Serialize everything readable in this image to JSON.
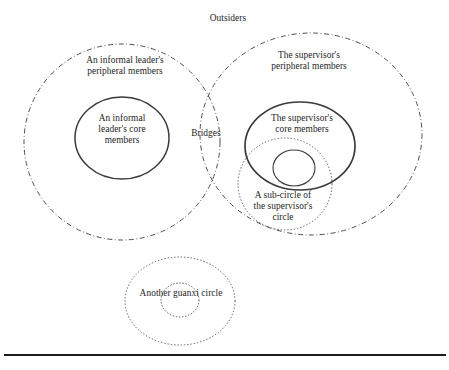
{
  "figure": {
    "background_color": "#ffffff",
    "stroke_color": "#3a3a3a",
    "labels": {
      "outsiders": "Outsiders",
      "leader_peripheral": "An informal leader's\nperipheral members",
      "leader_core": "An informal\nleader's core\nmembers",
      "bridges": "Bridges",
      "supervisor_peripheral": "The supervisor's\nperipheral members",
      "supervisor_core": "The supervisor's\ncore members",
      "sub_circle": "A sub-circle of\nthe supervisor's\ncircle",
      "another_guanxi": "Another guanxi circle"
    },
    "shapes": [
      {
        "name": "informal-leader-peripheral-circle",
        "style": "dash-dot",
        "cx": 122,
        "cy": 142,
        "rx": 98,
        "ry": 98
      },
      {
        "name": "supervisor-peripheral-circle",
        "style": "dash-dot",
        "cx": 311,
        "cy": 134,
        "rx": 111,
        "ry": 101
      },
      {
        "name": "informal-leader-core-circle",
        "style": "solid",
        "cx": 122,
        "cy": 138,
        "rx": 47,
        "ry": 41
      },
      {
        "name": "supervisor-core-circle",
        "style": "solid",
        "cx": 300,
        "cy": 146,
        "rx": 55,
        "ry": 44
      },
      {
        "name": "supervisor-sub-circle",
        "style": "dotted",
        "cx": 285,
        "cy": 184,
        "rx": 47,
        "ry": 46
      },
      {
        "name": "supervisor-inner-small-circle",
        "style": "solid",
        "cx": 294,
        "cy": 168,
        "rx": 21,
        "ry": 18
      },
      {
        "name": "another-guanxi-outer-circle",
        "style": "dotted",
        "cx": 180,
        "cy": 301,
        "rx": 55,
        "ry": 44
      },
      {
        "name": "another-guanxi-inner-circle",
        "style": "dotted",
        "cx": 180,
        "cy": 300,
        "rx": 19,
        "ry": 17
      }
    ],
    "bottom_rule": {
      "name": "bottom-divider",
      "y": 355,
      "x1": 4,
      "x2": 446,
      "thickness": 2.2
    }
  }
}
